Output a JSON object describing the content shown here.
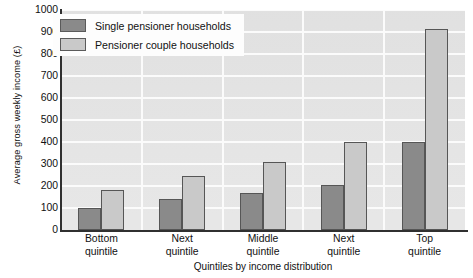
{
  "chart_data": {
    "type": "bar",
    "title": "",
    "xlabel": "Quintiles by income distribution",
    "ylabel": "Average gross weekly income (£)",
    "categories": [
      "Bottom quintile",
      "Next quintile",
      "Middle quintile",
      "Next quintile",
      "Top quintile"
    ],
    "category_lines": [
      [
        "Bottom",
        "quintile"
      ],
      [
        "Next",
        "quintile"
      ],
      [
        "Middle",
        "quintile"
      ],
      [
        "Next",
        "quintile"
      ],
      [
        "Top",
        "quintile"
      ]
    ],
    "series": [
      {
        "name": "Single pensioner households",
        "color": "#8a8a8a",
        "values": [
          100,
          140,
          170,
          205,
          400
        ]
      },
      {
        "name": "Pensioner couple households",
        "color": "#c9c9c9",
        "values": [
          180,
          245,
          310,
          400,
          915
        ]
      }
    ],
    "ylim": [
      0,
      1000
    ],
    "ytick_step": 100,
    "yticks": [
      0,
      100,
      200,
      300,
      400,
      500,
      600,
      700,
      800,
      900,
      1000
    ],
    "ytick_labels": [
      "0",
      "100",
      "200",
      "300",
      "400",
      "500",
      "600",
      "700",
      "800",
      "900",
      "1000"
    ],
    "grid": "horizontal-and-vertical",
    "grid_color": "#fbfbfb",
    "plot_background": "#e6e6e6",
    "legend_position": "top-left"
  },
  "legend": {
    "items": [
      {
        "label": "Single pensioner households",
        "swatch": "single"
      },
      {
        "label": "Pensioner couple households",
        "swatch": "couple"
      }
    ]
  }
}
